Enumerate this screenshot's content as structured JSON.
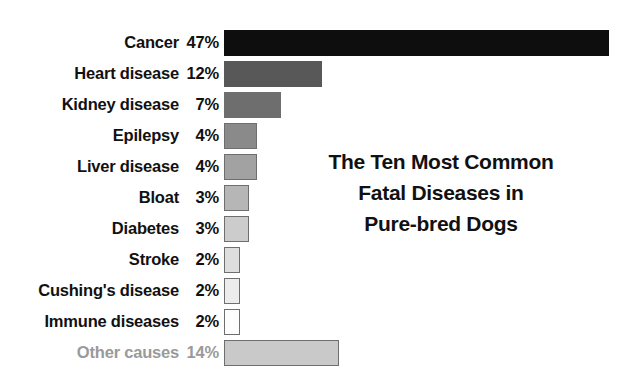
{
  "title": {
    "lines": [
      "The Ten Most Common",
      "Fatal Diseases in",
      "Pure-bred Dogs"
    ],
    "full": "The Ten Most Common Fatal Diseases in Pure-bred Dogs"
  },
  "colors": {
    "background": "#ffffff",
    "label_text": "#111111",
    "muted_text": "#9a9a9a",
    "bar_border": "#6e6e6e"
  },
  "chart_data": {
    "type": "bar",
    "orientation": "horizontal",
    "xlabel": "",
    "ylabel": "",
    "xlim": [
      0,
      47
    ],
    "grid": false,
    "legend": false,
    "value_suffix": "%",
    "categories": [
      "Cancer",
      "Heart disease",
      "Kidney disease",
      "Epilepsy",
      "Liver disease",
      "Bloat",
      "Diabetes",
      "Stroke",
      "Cushing's disease",
      "Immune diseases",
      "Other causes"
    ],
    "values": [
      47,
      12,
      7,
      4,
      4,
      3,
      3,
      2,
      2,
      2,
      14
    ],
    "value_labels": [
      "47%",
      "12%",
      "7%",
      "4%",
      "4%",
      "3%",
      "3%",
      "2%",
      "2%",
      "2%",
      "14%"
    ],
    "bar_colors": [
      "#0e0e0e",
      "#585858",
      "#6e6e6e",
      "#8a8a8a",
      "#a2a2a2",
      "#b6b6b6",
      "#cccccc",
      "#dedede",
      "#ececec",
      "#fdfdfd",
      "#c9c9c9"
    ],
    "rows": [
      {
        "label": "Cancer",
        "value": 47,
        "value_label": "47%",
        "color": "#0e0e0e",
        "muted": false
      },
      {
        "label": "Heart disease",
        "value": 12,
        "value_label": "12%",
        "color": "#585858",
        "muted": false
      },
      {
        "label": "Kidney disease",
        "value": 7,
        "value_label": "7%",
        "color": "#6e6e6e",
        "muted": false
      },
      {
        "label": "Epilepsy",
        "value": 4,
        "value_label": "4%",
        "color": "#8a8a8a",
        "muted": false
      },
      {
        "label": "Liver disease",
        "value": 4,
        "value_label": "4%",
        "color": "#a2a2a2",
        "muted": false
      },
      {
        "label": "Bloat",
        "value": 3,
        "value_label": "3%",
        "color": "#b6b6b6",
        "muted": false
      },
      {
        "label": "Diabetes",
        "value": 3,
        "value_label": "3%",
        "color": "#cccccc",
        "muted": false
      },
      {
        "label": "Stroke",
        "value": 2,
        "value_label": "2%",
        "color": "#dedede",
        "muted": false
      },
      {
        "label": "Cushing's disease",
        "value": 2,
        "value_label": "2%",
        "color": "#ececec",
        "muted": false
      },
      {
        "label": "Immune diseases",
        "value": 2,
        "value_label": "2%",
        "color": "#fdfdfd",
        "muted": false
      },
      {
        "label": "Other causes",
        "value": 14,
        "value_label": "14%",
        "color": "#c9c9c9",
        "muted": true
      }
    ]
  }
}
